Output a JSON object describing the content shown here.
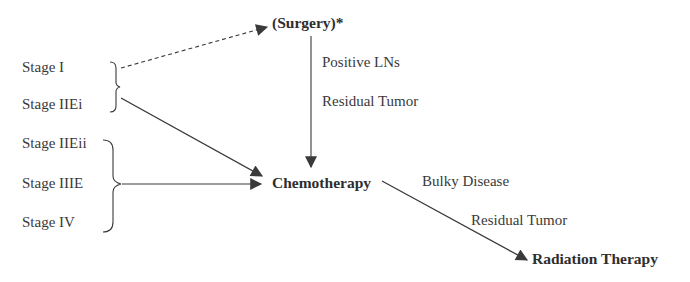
{
  "stages": [
    {
      "label": "Stage I"
    },
    {
      "label": "Stage IIEi"
    },
    {
      "label": "Stage IIEii"
    },
    {
      "label": "Stage IIIE"
    },
    {
      "label": "Stage IV"
    }
  ],
  "nodes": {
    "surgery": "(Surgery)*",
    "chemotherapy": "Chemotherapy",
    "radiation": "Radiation Therapy"
  },
  "edge_labels": {
    "surgery_to_chemo": [
      "Positive LNs",
      "Residual Tumor"
    ],
    "chemo_to_radiation": [
      "Bulky Disease",
      "Residual Tumor"
    ]
  },
  "colors": {
    "line": "#3a3a3a",
    "text": "#333333"
  }
}
